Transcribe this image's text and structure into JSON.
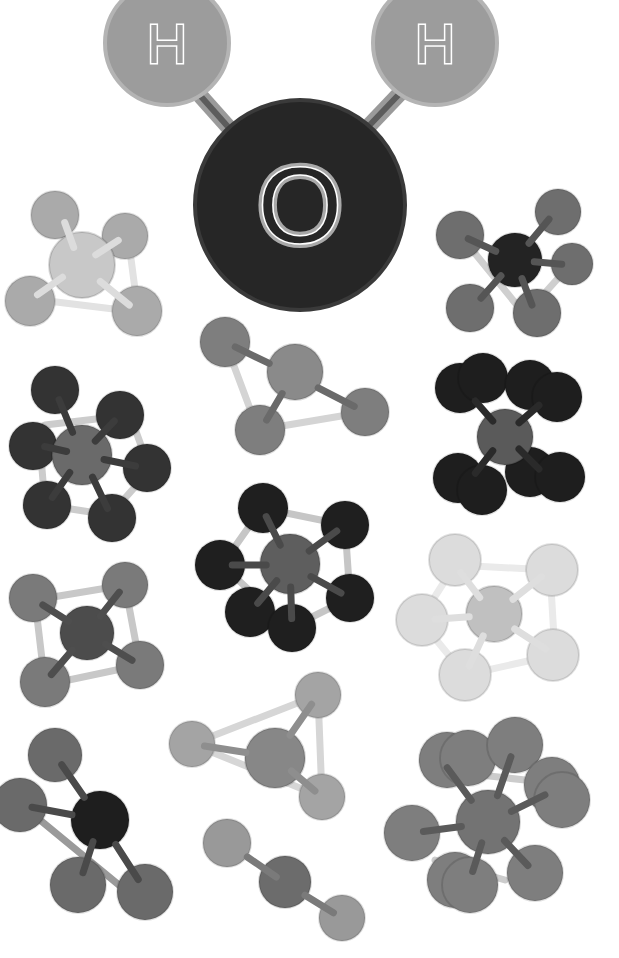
{
  "palette": {
    "background": "#ffffff",
    "hydrogen": "#9a9a9a",
    "oxygen": "#262626",
    "bond_dark": "#6e6e6e",
    "bond_light": "#d2d2d2"
  },
  "water": {
    "atoms": [
      {
        "id": "H1",
        "label": "H",
        "cx": 167,
        "cy": 43,
        "r": 62,
        "fill": "#9c9c9c",
        "stroke": "#b4b4b4"
      },
      {
        "id": "H2",
        "label": "H",
        "cx": 435,
        "cy": 43,
        "r": 62,
        "fill": "#9c9c9c",
        "stroke": "#b4b4b4"
      },
      {
        "id": "O",
        "label": "O",
        "cx": 300,
        "cy": 205,
        "r": 105,
        "fill": "#262626",
        "stroke": "#3a3a3a"
      }
    ],
    "bonds": [
      {
        "x1": 197,
        "y1": 92,
        "x2": 238,
        "y2": 138
      },
      {
        "x1": 405,
        "y1": 88,
        "x2": 365,
        "y2": 130
      }
    ]
  },
  "molecules": [
    {
      "name": "tetrahedral-light-top-left",
      "frames": [
        [
          40,
          300,
          138,
          312
        ],
        [
          128,
          236,
          138,
          312
        ]
      ],
      "bonds": [
        [
          80,
          265,
          62,
          215
        ],
        [
          80,
          265,
          125,
          236
        ],
        [
          80,
          265,
          30,
          300
        ],
        [
          80,
          265,
          138,
          312
        ]
      ],
      "center": {
        "cx": 82,
        "cy": 265,
        "r": 33,
        "fill": "#c8c8c8"
      },
      "atoms": [
        [
          55,
          215,
          24
        ],
        [
          125,
          236,
          23
        ],
        [
          30,
          301,
          25
        ],
        [
          137,
          311,
          25
        ]
      ],
      "atom_fill": "#aaaaaa",
      "frame_color": "#e2e2e2",
      "bond_color": "#dcdcdc"
    },
    {
      "name": "tetrahedral-dark-top-right",
      "frames": [
        [
          460,
          235,
          525,
          315
        ],
        [
          570,
          265,
          525,
          315
        ]
      ],
      "bonds": [
        [
          515,
          260,
          460,
          235
        ],
        [
          515,
          260,
          555,
          212
        ],
        [
          515,
          260,
          570,
          265
        ],
        [
          515,
          260,
          475,
          305
        ],
        [
          515,
          260,
          535,
          313
        ]
      ],
      "center": {
        "cx": 515,
        "cy": 260,
        "r": 27,
        "fill": "#232323"
      },
      "atoms": [
        [
          460,
          235,
          24
        ],
        [
          558,
          212,
          23
        ],
        [
          572,
          264,
          21
        ],
        [
          470,
          308,
          24
        ],
        [
          537,
          313,
          24
        ]
      ],
      "atom_fill": "#6e6e6e",
      "frame_color": "#cfcfcf",
      "bond_color": "#555555"
    },
    {
      "name": "trigonal-center-upper",
      "frames": [
        [
          225,
          342,
          258,
          430
        ],
        [
          258,
          430,
          365,
          412
        ]
      ],
      "bonds": [
        [
          293,
          375,
          225,
          342
        ],
        [
          293,
          375,
          365,
          412
        ],
        [
          293,
          375,
          262,
          428
        ]
      ],
      "center": {
        "cx": 295,
        "cy": 372,
        "r": 28,
        "fill": "#8a8a8a"
      },
      "atoms": [
        [
          225,
          342,
          25
        ],
        [
          365,
          412,
          24
        ],
        [
          260,
          430,
          25
        ]
      ],
      "atom_fill": "#7e7e7e",
      "frame_color": "#d4d4d4",
      "bond_color": "#6a6a6a"
    },
    {
      "name": "octahedral-left",
      "frames": [
        [
          45,
          425,
          130,
          415
        ],
        [
          130,
          415,
          150,
          470
        ],
        [
          150,
          470,
          110,
          515
        ],
        [
          110,
          515,
          45,
          505
        ],
        [
          45,
          505,
          40,
          445
        ]
      ],
      "bonds": [
        [
          82,
          455,
          55,
          390
        ],
        [
          82,
          455,
          120,
          415
        ],
        [
          82,
          455,
          38,
          445
        ],
        [
          82,
          455,
          145,
          468
        ],
        [
          82,
          455,
          47,
          505
        ],
        [
          82,
          455,
          112,
          518
        ]
      ],
      "center": {
        "cx": 82,
        "cy": 455,
        "r": 30,
        "fill": "#6a6a6a"
      },
      "atoms": [
        [
          55,
          390,
          24
        ],
        [
          120,
          415,
          24
        ],
        [
          33,
          446,
          24
        ],
        [
          147,
          468,
          24
        ],
        [
          47,
          505,
          24
        ],
        [
          112,
          518,
          24
        ]
      ],
      "atom_fill": "#333333",
      "frame_color": "#cccccc",
      "bond_color": "#3c3c3c"
    },
    {
      "name": "square-planar-dark-right",
      "frames": [],
      "bonds": [
        [
          505,
          435,
          470,
          395
        ],
        [
          505,
          435,
          545,
          400
        ],
        [
          505,
          435,
          470,
          480
        ],
        [
          505,
          435,
          545,
          475
        ]
      ],
      "center": {
        "cx": 505,
        "cy": 437,
        "r": 28,
        "fill": "#5a5a5a"
      },
      "atoms": [
        [
          460,
          388,
          25
        ],
        [
          483,
          378,
          25
        ],
        [
          530,
          385,
          25
        ],
        [
          557,
          397,
          25
        ],
        [
          458,
          478,
          25
        ],
        [
          482,
          490,
          25
        ],
        [
          530,
          472,
          25
        ],
        [
          560,
          477,
          25
        ]
      ],
      "atom_fill": "#1e1e1e",
      "frame_color": "#aaaaaa",
      "bond_color": "#2a2a2a"
    },
    {
      "name": "octahedral-center",
      "frames": [
        [
          262,
          508,
          345,
          525
        ],
        [
          345,
          525,
          350,
          598
        ],
        [
          350,
          598,
          290,
          628
        ],
        [
          290,
          628,
          222,
          565
        ],
        [
          222,
          565,
          262,
          508
        ]
      ],
      "bonds": [
        [
          290,
          565,
          262,
          508
        ],
        [
          290,
          565,
          345,
          525
        ],
        [
          290,
          565,
          222,
          565
        ],
        [
          290,
          565,
          350,
          598
        ],
        [
          290,
          565,
          252,
          610
        ],
        [
          290,
          565,
          292,
          628
        ]
      ],
      "center": {
        "cx": 290,
        "cy": 564,
        "r": 30,
        "fill": "#5e5e5e"
      },
      "atoms": [
        [
          263,
          508,
          25
        ],
        [
          345,
          525,
          24
        ],
        [
          220,
          565,
          25
        ],
        [
          350,
          598,
          24
        ],
        [
          250,
          612,
          25
        ],
        [
          292,
          628,
          24
        ]
      ],
      "atom_fill": "#1f1f1f",
      "frame_color": "#c6c6c6",
      "bond_color": "#4a4a4a"
    },
    {
      "name": "square-pyramidal-left-lower",
      "frames": [
        [
          35,
          600,
          125,
          585
        ],
        [
          125,
          585,
          140,
          665
        ],
        [
          140,
          665,
          45,
          685
        ],
        [
          45,
          685,
          35,
          600
        ]
      ],
      "bonds": [
        [
          87,
          633,
          35,
          600
        ],
        [
          87,
          633,
          125,
          585
        ],
        [
          87,
          633,
          45,
          682
        ],
        [
          87,
          633,
          140,
          665
        ]
      ],
      "center": {
        "cx": 87,
        "cy": 633,
        "r": 27,
        "fill": "#4c4c4c"
      },
      "atoms": [
        [
          33,
          598,
          24
        ],
        [
          125,
          585,
          23
        ],
        [
          45,
          682,
          25
        ],
        [
          140,
          665,
          24
        ]
      ],
      "atom_fill": "#7a7a7a",
      "frame_color": "#c8c8c8",
      "bond_color": "#4e4e4e"
    },
    {
      "name": "octahedral-faded-right",
      "frames": [
        [
          455,
          565,
          550,
          570
        ],
        [
          550,
          570,
          555,
          655
        ],
        [
          555,
          655,
          465,
          675
        ],
        [
          465,
          675,
          420,
          620
        ],
        [
          420,
          620,
          455,
          565
        ]
      ],
      "bonds": [
        [
          493,
          615,
          455,
          565
        ],
        [
          493,
          615,
          550,
          570
        ],
        [
          493,
          615,
          425,
          620
        ],
        [
          493,
          615,
          555,
          655
        ],
        [
          493,
          615,
          465,
          675
        ]
      ],
      "center": {
        "cx": 494,
        "cy": 614,
        "r": 28,
        "fill": "#c0c0c0"
      },
      "atoms": [
        [
          455,
          560,
          26
        ],
        [
          552,
          570,
          26
        ],
        [
          422,
          620,
          26
        ],
        [
          553,
          655,
          26
        ],
        [
          465,
          675,
          26
        ]
      ],
      "atom_fill": "#dcdcdc",
      "frame_color": "#eaeaea",
      "bond_color": "#dedede"
    },
    {
      "name": "tetrahedral-bottom-left",
      "frames": [
        [
          40,
          820,
          125,
          890
        ]
      ],
      "bonds": [
        [
          100,
          820,
          55,
          755
        ],
        [
          100,
          820,
          20,
          805
        ],
        [
          100,
          820,
          80,
          882
        ],
        [
          100,
          820,
          145,
          890
        ]
      ],
      "center": {
        "cx": 100,
        "cy": 820,
        "r": 29,
        "fill": "#1e1e1e"
      },
      "atoms": [
        [
          55,
          755,
          27
        ],
        [
          20,
          805,
          27
        ],
        [
          78,
          885,
          28
        ],
        [
          145,
          892,
          28
        ]
      ],
      "atom_fill": "#6a6a6a",
      "frame_color": "#9a9a9a",
      "bond_color": "#4a4a4a"
    },
    {
      "name": "tetrahedral-triangle-lower-center",
      "frames": [
        [
          192,
          744,
          318,
          695
        ],
        [
          318,
          695,
          322,
          797
        ],
        [
          322,
          797,
          192,
          744
        ]
      ],
      "bonds": [
        [
          275,
          757,
          192,
          744
        ],
        [
          275,
          757,
          318,
          695
        ],
        [
          275,
          757,
          322,
          797
        ]
      ],
      "center": {
        "cx": 275,
        "cy": 758,
        "r": 30,
        "fill": "#878787"
      },
      "atoms": [
        [
          192,
          744,
          23
        ],
        [
          318,
          695,
          23
        ],
        [
          322,
          797,
          23
        ]
      ],
      "atom_fill": "#a4a4a4",
      "frame_color": "#d6d6d6",
      "bond_color": "#8e8e8e"
    },
    {
      "name": "linear-bottom-center",
      "frames": [],
      "bonds": [
        [
          227,
          843,
          285,
          883
        ],
        [
          285,
          883,
          342,
          918
        ]
      ],
      "center": {
        "cx": 285,
        "cy": 882,
        "r": 26,
        "fill": "#6c6c6c"
      },
      "atoms": [
        [
          227,
          843,
          24
        ],
        [
          342,
          918,
          23
        ]
      ],
      "atom_fill": "#999999",
      "frame_color": "#cccccc",
      "bond_color": "#7a7a7a"
    },
    {
      "name": "octahedral-cluster-bottom-right",
      "frames": [
        [
          480,
          775,
          525,
          780
        ],
        [
          435,
          860,
          505,
          880
        ]
      ],
      "bonds": [
        [
          488,
          823,
          440,
          758
        ],
        [
          488,
          823,
          515,
          745
        ],
        [
          488,
          823,
          555,
          790
        ],
        [
          488,
          823,
          412,
          833
        ],
        [
          488,
          823,
          470,
          880
        ],
        [
          488,
          823,
          535,
          873
        ]
      ],
      "center": {
        "cx": 488,
        "cy": 822,
        "r": 32,
        "fill": "#737373"
      },
      "atoms": [
        [
          447,
          760,
          28
        ],
        [
          468,
          758,
          28
        ],
        [
          515,
          745,
          28
        ],
        [
          552,
          785,
          28
        ],
        [
          562,
          800,
          28
        ],
        [
          412,
          833,
          28
        ],
        [
          455,
          880,
          28
        ],
        [
          470,
          885,
          28
        ],
        [
          535,
          873,
          28
        ]
      ],
      "atom_fill": "#7e7e7e",
      "frame_color": "#cccccc",
      "bond_color": "#5a5a5a"
    }
  ]
}
